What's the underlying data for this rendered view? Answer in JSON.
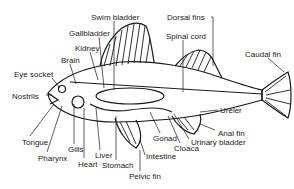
{
  "diagram": {
    "labels": [
      {
        "id": "swim-bladder",
        "text": "Swim bladder",
        "x": 91,
        "y": 13
      },
      {
        "id": "dorsal-fins",
        "text": "Dorsal fins",
        "x": 167,
        "y": 13
      },
      {
        "id": "gallbladder",
        "text": "Gallbladder",
        "x": 69,
        "y": 29
      },
      {
        "id": "spinal-cord",
        "text": "Spinal cord",
        "x": 166,
        "y": 32
      },
      {
        "id": "kidney",
        "text": "Kidney",
        "x": 75,
        "y": 44
      },
      {
        "id": "caudal-fin",
        "text": "Caudal fin",
        "x": 245,
        "y": 50
      },
      {
        "id": "brain",
        "text": "Brain",
        "x": 61,
        "y": 56
      },
      {
        "id": "eye-socket",
        "text": "Eye socket",
        "x": 14,
        "y": 70
      },
      {
        "id": "nostrils",
        "text": "Nostrils",
        "x": 12,
        "y": 92
      },
      {
        "id": "ureter",
        "text": "Ureler",
        "x": 220,
        "y": 106
      },
      {
        "id": "tongue",
        "text": "Tongue",
        "x": 22,
        "y": 138
      },
      {
        "id": "anal-fin",
        "text": "Anal fin",
        "x": 218,
        "y": 129
      },
      {
        "id": "gonad",
        "text": "Gonad",
        "x": 153,
        "y": 134
      },
      {
        "id": "urinary-bladder",
        "text": "Urinary bladder",
        "x": 191,
        "y": 138
      },
      {
        "id": "gills",
        "text": "Gills",
        "x": 68,
        "y": 145
      },
      {
        "id": "cloaca",
        "text": "Cloaca",
        "x": 174,
        "y": 144
      },
      {
        "id": "liver",
        "text": "Liver",
        "x": 95,
        "y": 151
      },
      {
        "id": "pharynx",
        "text": "Pharynx",
        "x": 38,
        "y": 154
      },
      {
        "id": "intestine",
        "text": "Intestine",
        "x": 146,
        "y": 152
      },
      {
        "id": "heart",
        "text": "Heart",
        "x": 78,
        "y": 160
      },
      {
        "id": "stomach",
        "text": "Stomach",
        "x": 102,
        "y": 161
      },
      {
        "id": "pelvic-fin",
        "text": "Pelvic fin",
        "x": 129,
        "y": 172
      }
    ]
  }
}
